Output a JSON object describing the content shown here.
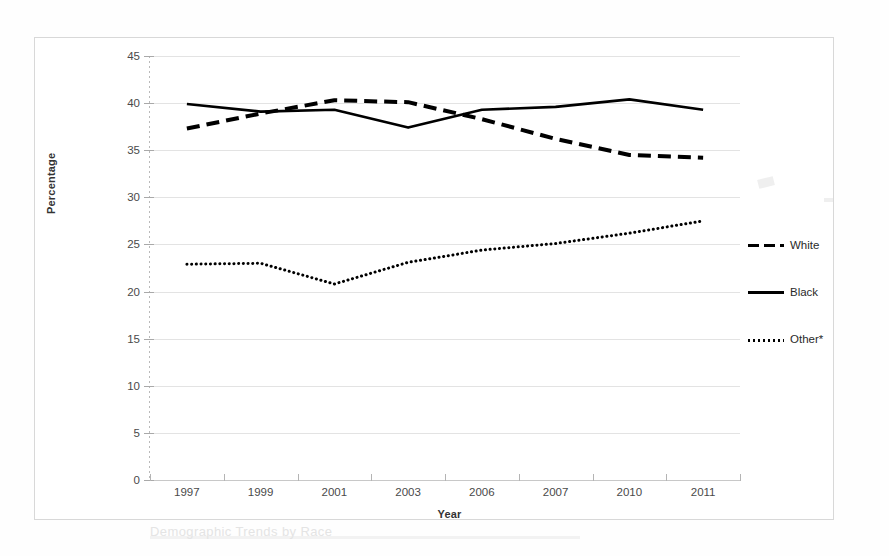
{
  "figure": {
    "y_axis_title": "Percentage",
    "x_axis_title": "Year",
    "caption_fragment": "Demographic Trends by Race"
  },
  "legend": {
    "position": "right",
    "items": [
      {
        "label": "White",
        "style": "dashed",
        "swatch": "dashed-line-swatch"
      },
      {
        "label": "Black",
        "style": "solid",
        "swatch": "solid-line-swatch"
      },
      {
        "label": "Other*",
        "style": "dotted",
        "swatch": "dotted-line-swatch"
      }
    ]
  },
  "chart_data": {
    "type": "line",
    "title": "",
    "subtitle": "",
    "xlabel": "Year",
    "ylabel": "Percentage",
    "categories": [
      "1997",
      "1999",
      "2001",
      "2003",
      "2006",
      "2007",
      "2010",
      "2011"
    ],
    "ylim": [
      0,
      45
    ],
    "ytick_step": 5,
    "yticks": [
      0,
      5,
      10,
      15,
      20,
      25,
      30,
      35,
      40,
      45
    ],
    "grid": true,
    "grid_axis": "y",
    "legend_position": "right",
    "annotations": [
      "* Other includes all remaining race categories"
    ],
    "series": [
      {
        "name": "White",
        "style": "dashed",
        "color": "#000000",
        "values": [
          37.3,
          38.9,
          40.3,
          40.1,
          38.3,
          36.2,
          34.5,
          34.2
        ]
      },
      {
        "name": "Black",
        "style": "solid",
        "color": "#000000",
        "values": [
          39.9,
          39.1,
          39.3,
          37.4,
          39.3,
          39.6,
          40.4,
          39.3
        ]
      },
      {
        "name": "Other*",
        "style": "dotted",
        "color": "#000000",
        "values": [
          22.9,
          23.0,
          20.8,
          23.1,
          24.4,
          25.1,
          26.2,
          27.5
        ]
      }
    ]
  }
}
